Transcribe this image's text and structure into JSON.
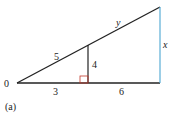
{
  "diagram": {
    "caption": "(a)",
    "origin_label": "0",
    "segments": {
      "hyp_lower": "5",
      "hyp_upper": "y",
      "inner_height": "4",
      "base_left": "3",
      "base_right": "6",
      "outer_height": "x"
    },
    "colors": {
      "line": "#222222",
      "outer_vertical": "#5aaed6",
      "right_angle": "#c0392b"
    }
  }
}
